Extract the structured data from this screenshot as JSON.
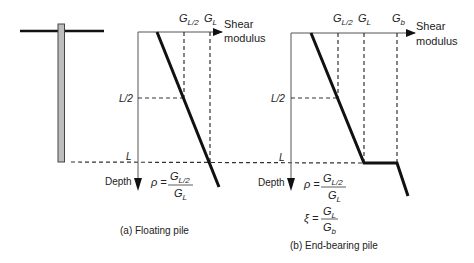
{
  "figure": {
    "colors": {
      "line": "#111111",
      "dashed": "#333333",
      "pile_fill": "#bdbdbd",
      "axis": "#555555"
    },
    "panel_a": {
      "caption": "(a) Floating pile",
      "x_axis_label_1": "Shear",
      "x_axis_label_2": "modulus",
      "y_axis_label": "Depth",
      "g_half_label": "G",
      "g_half_sub": "L/2",
      "g_l_label": "G",
      "g_l_sub": "L",
      "half_depth_label": "L/2",
      "depth_label": "L",
      "rho_symbol": "ρ =",
      "rho_num": "G",
      "rho_num_sub": "L/2",
      "rho_den": "G",
      "rho_den_sub": "L"
    },
    "panel_b": {
      "caption": "(b) End-bearing pile",
      "x_axis_label_1": "Shear",
      "x_axis_label_2": "modulus",
      "y_axis_label": "Depth",
      "g_half_label": "G",
      "g_half_sub": "L/2",
      "g_l_label": "G",
      "g_l_sub": "L",
      "g_b_label": "G",
      "g_b_sub": "b",
      "half_depth_label": "L/2",
      "depth_label": "L",
      "rho_symbol": "ρ =",
      "rho_num": "G",
      "rho_num_sub": "L/2",
      "rho_den": "G",
      "rho_den_sub": "L",
      "xi_symbol": "ξ =",
      "xi_num": "G",
      "xi_num_sub": "L",
      "xi_den": "G",
      "xi_den_sub": "b"
    }
  }
}
